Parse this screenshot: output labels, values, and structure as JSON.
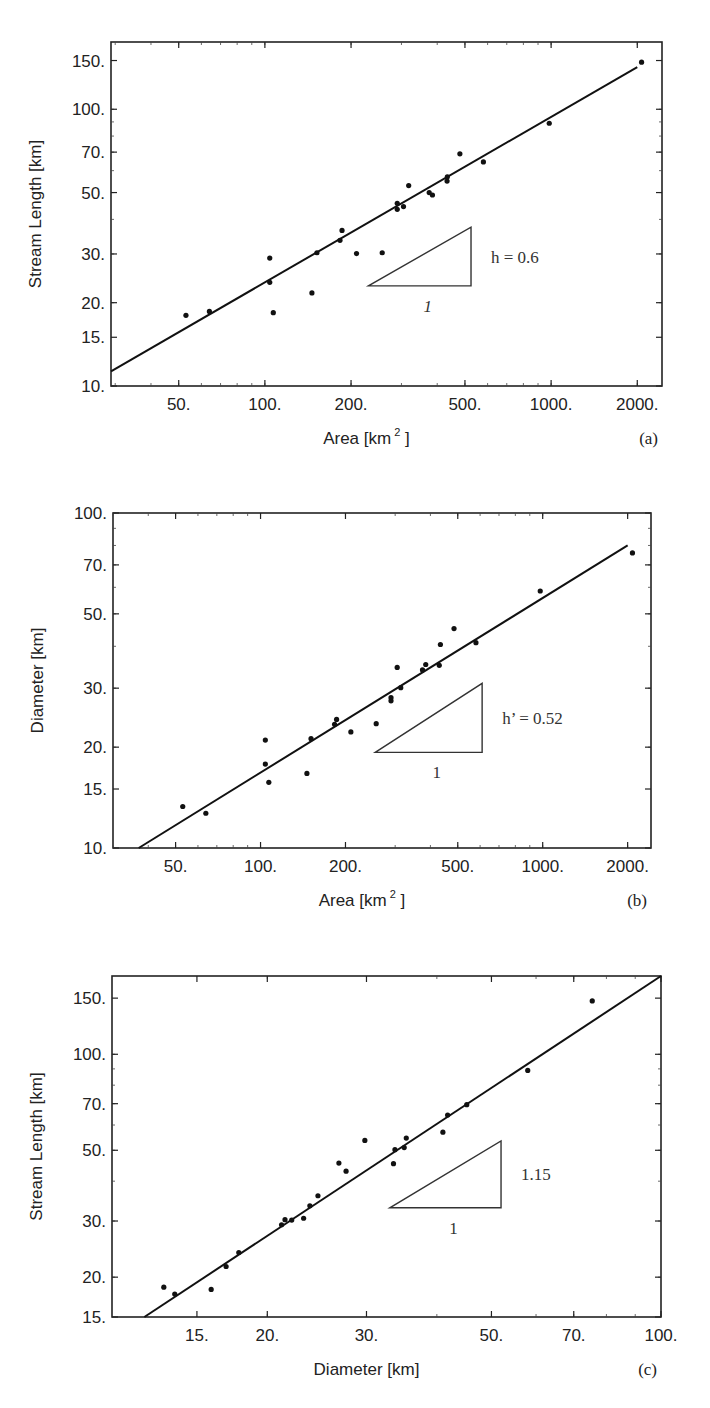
{
  "chart_data": [
    {
      "type": "scatter",
      "panel": "(a)",
      "xscale": "log",
      "yscale": "log",
      "xlabel": "Area [km 2 ]",
      "ylabel": "Stream Length [km]",
      "xlim": [
        29,
        2440
      ],
      "ylim": [
        10,
        175
      ],
      "xticks": [
        50,
        100,
        200,
        500,
        1000,
        2000
      ],
      "xtick_labels": [
        "50.",
        "100.",
        "200.",
        "500.",
        "1000.",
        "2000."
      ],
      "yticks": [
        10,
        15,
        20,
        30,
        50,
        70,
        100,
        150
      ],
      "ytick_labels": [
        "10.",
        "15.",
        "20.",
        "30.",
        "50.",
        "70.",
        "100.",
        "150."
      ],
      "frame": {
        "x0": 111,
        "y0": 42,
        "x1": 662,
        "y1": 386
      },
      "points": [
        [
          53,
          18
        ],
        [
          64,
          18.6
        ],
        [
          104,
          29
        ],
        [
          104,
          23.7
        ],
        [
          107,
          18.4
        ],
        [
          146,
          21.7
        ],
        [
          152,
          30.3
        ],
        [
          183,
          33.6
        ],
        [
          186,
          36.5
        ],
        [
          209,
          30.1
        ],
        [
          257,
          30.3
        ],
        [
          290,
          45.7
        ],
        [
          290,
          43.5
        ],
        [
          305,
          44.5
        ],
        [
          318,
          53
        ],
        [
          375,
          50
        ],
        [
          385,
          49
        ],
        [
          433,
          55
        ],
        [
          434,
          57
        ],
        [
          480,
          69
        ],
        [
          580,
          64.5
        ],
        [
          985,
          89
        ],
        [
          2070,
          148
        ]
      ],
      "fit_line": {
        "x": [
          29,
          2000
        ],
        "y": [
          11.3,
          142
        ],
        "exponent": 0.6
      },
      "annotation": {
        "text": "h = 0.6",
        "run_label": "1",
        "triangle": {
          "x0": 230,
          "x1": 525,
          "y_base": 23.0,
          "y_top": 37.5
        }
      }
    },
    {
      "type": "scatter",
      "panel": "(b)",
      "xscale": "log",
      "yscale": "log",
      "xlabel": "Area [km 2 ]",
      "ylabel": "Diameter [km]",
      "xlim": [
        30,
        2420
      ],
      "ylim": [
        10,
        100
      ],
      "xticks": [
        50,
        100,
        200,
        500,
        1000,
        2000
      ],
      "xtick_labels": [
        "50.",
        "100.",
        "200.",
        "500.",
        "1000.",
        "2000."
      ],
      "yticks": [
        10,
        15,
        20,
        30,
        50,
        70,
        100
      ],
      "ytick_labels": [
        "10.",
        "15.",
        "20.",
        "30.",
        "50.",
        "70.",
        "100."
      ],
      "frame": {
        "x0": 113,
        "y0": 513,
        "x1": 651,
        "y1": 848
      },
      "points": [
        [
          53,
          13.3
        ],
        [
          64,
          12.7
        ],
        [
          104,
          21
        ],
        [
          104,
          17.8
        ],
        [
          107,
          15.7
        ],
        [
          146,
          16.7
        ],
        [
          151,
          21.2
        ],
        [
          183,
          23.4
        ],
        [
          186,
          24.2
        ],
        [
          209,
          22.2
        ],
        [
          257,
          23.5
        ],
        [
          290,
          27.5
        ],
        [
          290,
          28.1
        ],
        [
          305,
          34.6
        ],
        [
          314,
          30.1
        ],
        [
          375,
          34
        ],
        [
          385,
          35.3
        ],
        [
          430,
          35.1
        ],
        [
          434,
          40.5
        ],
        [
          485,
          45.2
        ],
        [
          580,
          41
        ],
        [
          980,
          58.5
        ],
        [
          2080,
          76
        ]
      ],
      "fit_line": {
        "x": [
          37,
          2000
        ],
        "y": [
          10,
          80
        ],
        "exponent": 0.52
      },
      "annotation": {
        "text": "h’ = 0.52",
        "run_label": "1",
        "triangle": {
          "x0": 255,
          "x1": 610,
          "y_base": 19.3,
          "y_top": 31.0
        }
      }
    },
    {
      "type": "scatter",
      "panel": "(c)",
      "xscale": "log",
      "yscale": "log",
      "xlabel": "Diameter [km]",
      "ylabel": "Stream Length [km]",
      "xlim": [
        10.6,
        100
      ],
      "ylim": [
        15,
        176
      ],
      "xticks": [
        15,
        20,
        30,
        50,
        70,
        100
      ],
      "xtick_labels": [
        "15.",
        "20.",
        "30.",
        "50.",
        "70.",
        "100."
      ],
      "yticks": [
        15,
        20,
        30,
        50,
        70,
        100,
        150
      ],
      "ytick_labels": [
        "15.",
        "20.",
        "30.",
        "50.",
        "70.",
        "100.",
        "150."
      ],
      "frame": {
        "x0": 112,
        "y0": 976,
        "x1": 661,
        "y1": 1317
      },
      "points": [
        [
          13.1,
          18.6
        ],
        [
          13.7,
          17.7
        ],
        [
          15.9,
          18.3
        ],
        [
          16.9,
          21.6
        ],
        [
          17.8,
          23.9
        ],
        [
          21.2,
          29.2
        ],
        [
          21.5,
          30.3
        ],
        [
          22.1,
          30.2
        ],
        [
          23.2,
          30.6
        ],
        [
          23.8,
          33.5
        ],
        [
          24.6,
          36
        ],
        [
          26.8,
          45.6
        ],
        [
          27.6,
          43
        ],
        [
          29.8,
          53.7
        ],
        [
          33.5,
          45.4
        ],
        [
          33.7,
          50.2
        ],
        [
          35,
          51
        ],
        [
          35.3,
          54.6
        ],
        [
          41,
          57
        ],
        [
          41.8,
          64.5
        ],
        [
          45.2,
          69.5
        ],
        [
          58,
          89
        ],
        [
          75.5,
          147
        ]
      ],
      "fit_line": {
        "x": [
          12.1,
          100
        ],
        "y": [
          15,
          176
        ],
        "exponent": 1.15
      },
      "annotation": {
        "text": "1.15",
        "run_label": "1",
        "triangle": {
          "x0": 33,
          "x1": 52,
          "y_base": 33.0,
          "y_top": 53.5
        }
      }
    }
  ]
}
